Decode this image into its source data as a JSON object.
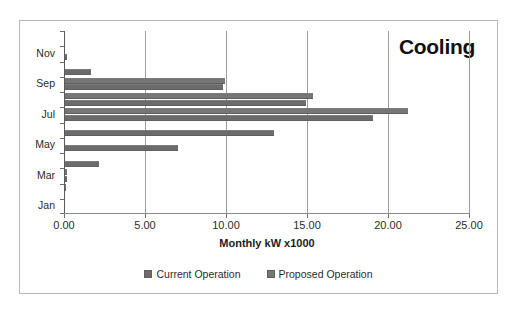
{
  "chart_data": {
    "type": "bar",
    "orientation": "horizontal",
    "title": "Cooling",
    "xlabel": "Monthly kW  x1000",
    "ylabel": "",
    "xlim": [
      0,
      25
    ],
    "xticks": [
      "0.00",
      "5.00",
      "10.00",
      "15.00",
      "20.00",
      "25.00"
    ],
    "xtick_values": [
      0,
      5,
      10,
      15,
      20,
      25
    ],
    "grid": "vertical",
    "legend_position": "bottom-center",
    "categories": [
      "Jan",
      "Feb",
      "Mar",
      "Apr",
      "May",
      "Jun",
      "Jul",
      "Aug",
      "Sep",
      "Oct",
      "Nov",
      "Dec"
    ],
    "category_labels_shown": [
      "Jan",
      "Mar",
      "May",
      "Jul",
      "Sep",
      "Nov"
    ],
    "series": [
      {
        "name": "Current Operation",
        "color": "#6b6b6b",
        "values": [
          0.0,
          0.0,
          0.15,
          2.1,
          6.95,
          12.9,
          19.0,
          14.9,
          9.75,
          1.6,
          0.12,
          0.0
        ]
      },
      {
        "name": "Proposed Operation",
        "color": "#767676",
        "values": [
          0.0,
          0.05,
          0.1,
          0.0,
          0.0,
          0.0,
          21.2,
          15.3,
          9.9,
          0.0,
          0.0,
          0.0
        ]
      }
    ]
  },
  "legend": {
    "items": [
      {
        "label": "Current Operation",
        "color": "#6b6b6b"
      },
      {
        "label": "Proposed Operation",
        "color": "#767676"
      }
    ]
  }
}
